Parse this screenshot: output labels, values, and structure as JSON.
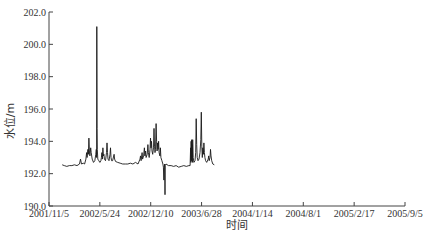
{
  "chart_data": {
    "type": "line",
    "title": "",
    "xlabel": "时间",
    "ylabel": "水位/m",
    "ylim": [
      190.0,
      202.0
    ],
    "yticks": [
      "190.0",
      "192.0",
      "194.0",
      "196.0",
      "198.0",
      "200.0",
      "202.0"
    ],
    "xticks": [
      "2001/11/5",
      "2002/5/24",
      "2002/12/10",
      "2003/6/28",
      "2004/1/14",
      "2004/8/1",
      "2005/2/17",
      "2005/9/5"
    ],
    "xlim": [
      "2001/11/5",
      "2005/9/5"
    ],
    "grid": false,
    "legend": null,
    "x_unit": "days since 2001/11/5",
    "series": [
      {
        "name": "水位",
        "color": "#1a1a1a",
        "points": [
          [
            52,
            192.55
          ],
          [
            60,
            192.5
          ],
          [
            70,
            192.45
          ],
          [
            80,
            192.5
          ],
          [
            90,
            192.5
          ],
          [
            100,
            192.55
          ],
          [
            110,
            192.5
          ],
          [
            120,
            192.6
          ],
          [
            124,
            192.9
          ],
          [
            128,
            192.6
          ],
          [
            135,
            192.65
          ],
          [
            140,
            192.6
          ],
          [
            145,
            192.9
          ],
          [
            148,
            193.3
          ],
          [
            150,
            193.0
          ],
          [
            153,
            193.5
          ],
          [
            155,
            193.2
          ],
          [
            157,
            194.2
          ],
          [
            159,
            193.4
          ],
          [
            161,
            193.1
          ],
          [
            164,
            193.6
          ],
          [
            166,
            193.3
          ],
          [
            170,
            192.9
          ],
          [
            175,
            192.7
          ],
          [
            180,
            192.8
          ],
          [
            184,
            193.2
          ],
          [
            186,
            193.5
          ],
          [
            187,
            193.0
          ],
          [
            188,
            201.1
          ],
          [
            189,
            194.8
          ],
          [
            190,
            193.5
          ],
          [
            192,
            192.9
          ],
          [
            196,
            192.8
          ],
          [
            200,
            192.7
          ],
          [
            204,
            192.8
          ],
          [
            206,
            193.0
          ],
          [
            208,
            193.3
          ],
          [
            210,
            192.9
          ],
          [
            212,
            193.6
          ],
          [
            214,
            193.1
          ],
          [
            216,
            193.2
          ],
          [
            218,
            192.9
          ],
          [
            222,
            192.8
          ],
          [
            226,
            193.3
          ],
          [
            228,
            193.9
          ],
          [
            230,
            193.3
          ],
          [
            232,
            192.9
          ],
          [
            236,
            192.8
          ],
          [
            240,
            193.2
          ],
          [
            242,
            193.6
          ],
          [
            244,
            193.0
          ],
          [
            246,
            192.8
          ],
          [
            250,
            192.8
          ],
          [
            256,
            193.2
          ],
          [
            258,
            192.9
          ],
          [
            262,
            192.75
          ],
          [
            270,
            192.7
          ],
          [
            280,
            192.65
          ],
          [
            290,
            192.6
          ],
          [
            300,
            192.6
          ],
          [
            310,
            192.6
          ],
          [
            320,
            192.65
          ],
          [
            330,
            192.6
          ],
          [
            340,
            192.7
          ],
          [
            350,
            192.6
          ],
          [
            358,
            192.9
          ],
          [
            360,
            193.1
          ],
          [
            362,
            192.8
          ],
          [
            366,
            193.3
          ],
          [
            368,
            192.9
          ],
          [
            372,
            193.1
          ],
          [
            375,
            193.6
          ],
          [
            377,
            193.1
          ],
          [
            380,
            193.4
          ],
          [
            382,
            193.0
          ],
          [
            386,
            193.2
          ],
          [
            389,
            193.8
          ],
          [
            391,
            193.3
          ],
          [
            394,
            193.0
          ],
          [
            397,
            193.5
          ],
          [
            399,
            194.2
          ],
          [
            401,
            193.6
          ],
          [
            403,
            194.0
          ],
          [
            405,
            193.4
          ],
          [
            408,
            193.2
          ],
          [
            411,
            193.6
          ],
          [
            413,
            194.8
          ],
          [
            415,
            193.7
          ],
          [
            417,
            193.3
          ],
          [
            419,
            193.5
          ],
          [
            421,
            195.1
          ],
          [
            423,
            194.0
          ],
          [
            425,
            193.4
          ],
          [
            427,
            193.9
          ],
          [
            429,
            193.5
          ],
          [
            431,
            194.0
          ],
          [
            433,
            193.3
          ],
          [
            436,
            193.1
          ],
          [
            438,
            193.6
          ],
          [
            440,
            193.0
          ],
          [
            444,
            192.8
          ],
          [
            448,
            192.6
          ],
          [
            450,
            192.4
          ],
          [
            452,
            191.6
          ],
          [
            453,
            192.4
          ],
          [
            455,
            192.6
          ],
          [
            456,
            190.7
          ],
          [
            457,
            192.5
          ],
          [
            460,
            192.6
          ],
          [
            470,
            192.5
          ],
          [
            480,
            192.5
          ],
          [
            490,
            192.45
          ],
          [
            500,
            192.5
          ],
          [
            510,
            192.4
          ],
          [
            520,
            192.45
          ],
          [
            530,
            192.5
          ],
          [
            540,
            192.45
          ],
          [
            550,
            192.5
          ],
          [
            555,
            192.5
          ],
          [
            557,
            193.6
          ],
          [
            558,
            192.7
          ],
          [
            559,
            194.0
          ],
          [
            560,
            192.8
          ],
          [
            561,
            194.1
          ],
          [
            562,
            193.0
          ],
          [
            563,
            193.8
          ],
          [
            564,
            192.7
          ],
          [
            565,
            194.1
          ],
          [
            567,
            193.0
          ],
          [
            570,
            192.7
          ],
          [
            574,
            192.8
          ],
          [
            577,
            193.3
          ],
          [
            579,
            195.4
          ],
          [
            581,
            193.8
          ],
          [
            583,
            193.0
          ],
          [
            586,
            192.8
          ],
          [
            590,
            192.9
          ],
          [
            594,
            193.3
          ],
          [
            597,
            194.1
          ],
          [
            599,
            195.8
          ],
          [
            601,
            193.7
          ],
          [
            603,
            193.0
          ],
          [
            605,
            193.6
          ],
          [
            607,
            193.2
          ],
          [
            609,
            193.9
          ],
          [
            611,
            193.3
          ],
          [
            613,
            193.0
          ],
          [
            616,
            192.8
          ],
          [
            620,
            192.7
          ],
          [
            626,
            192.9
          ],
          [
            628,
            193.1
          ],
          [
            630,
            192.8
          ],
          [
            633,
            193.0
          ],
          [
            635,
            193.5
          ],
          [
            637,
            193.1
          ],
          [
            640,
            192.8
          ],
          [
            644,
            192.6
          ],
          [
            650,
            192.55
          ]
        ]
      }
    ]
  }
}
